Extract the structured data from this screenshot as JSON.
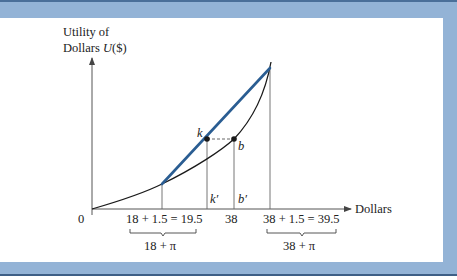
{
  "diagram": {
    "y_axis_label_line1": "Utility of",
    "y_axis_label_line2_prefix": "Dollars ",
    "y_axis_label_line2_fn": "U",
    "y_axis_label_line2_suffix": "($)",
    "x_axis_label": "Dollars",
    "origin_label": "0",
    "points": {
      "k": "k",
      "b": "b",
      "k_prime": "k′",
      "b_prime": "b′"
    },
    "ticks": {
      "low": "18 + 1.5 = 19.5",
      "mid": "38",
      "high": "38 + 1.5 = 39.5"
    },
    "braces": {
      "low": "18 + π",
      "high": "38 + π"
    },
    "colors": {
      "frame_blue": "#93b3d6",
      "chord_blue": "#2a5d92",
      "curve": "#1a1a1a",
      "guide_lines": "#555555"
    }
  }
}
